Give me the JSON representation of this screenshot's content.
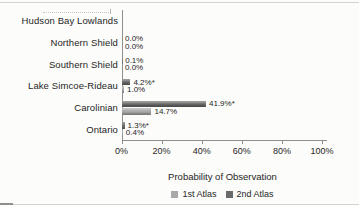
{
  "figure": {
    "background": "#fcfcfa"
  },
  "chart_data": {
    "type": "bar",
    "orientation": "horizontal",
    "title": "",
    "xlabel": "Probability of Observation",
    "ylabel": "",
    "xlim": [
      0,
      100
    ],
    "grid": false,
    "xticks": [
      "0%",
      "20%",
      "40%",
      "60%",
      "80%",
      "100%"
    ],
    "xtick_values": [
      0,
      20,
      40,
      60,
      80,
      100
    ],
    "categories": [
      "Hudson Bay Lowlands",
      "Northern Shield",
      "Southern Shield",
      "Lake Simcoe-Rideau",
      "Carolinian",
      "Ontario"
    ],
    "series": [
      {
        "name": "2nd Atlas",
        "color": "#6a6a6a",
        "row_position": "top",
        "values": [
          null,
          0.0,
          0.1,
          4.2,
          41.9,
          1.3
        ],
        "labels": [
          "",
          "0.0%",
          "0.1%",
          "4.2%*",
          "41.9%*",
          "1.3%*"
        ]
      },
      {
        "name": "1st Atlas",
        "color": "#a9a9a9",
        "row_position": "bottom",
        "values": [
          null,
          0.0,
          0.0,
          1.0,
          14.7,
          0.4
        ],
        "labels": [
          "",
          "0.0%",
          "0.0%",
          "1.0%",
          "14.7%",
          "0.4%"
        ]
      }
    ],
    "legend": {
      "position": "bottom",
      "items": [
        {
          "label": "1st Atlas",
          "color": "#a9a9a9"
        },
        {
          "label": "2nd Atlas",
          "color": "#6a6a6a"
        }
      ]
    }
  }
}
